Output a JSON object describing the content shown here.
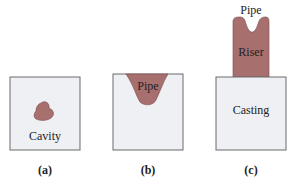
{
  "colors": {
    "box_fill": "#eef0f3",
    "box_stroke": "#6b6b6b",
    "metal": "#a86f6f",
    "metal_stroke": "#7a4a4a",
    "text": "#222222"
  },
  "panels": [
    {
      "caption": "(a)",
      "labels": {
        "cavity": "Cavity"
      }
    },
    {
      "caption": "(b)",
      "labels": {
        "pipe": "Pipe"
      }
    },
    {
      "caption": "(c)",
      "labels": {
        "pipe": "Pipe",
        "riser": "Riser",
        "casting": "Casting"
      }
    }
  ]
}
